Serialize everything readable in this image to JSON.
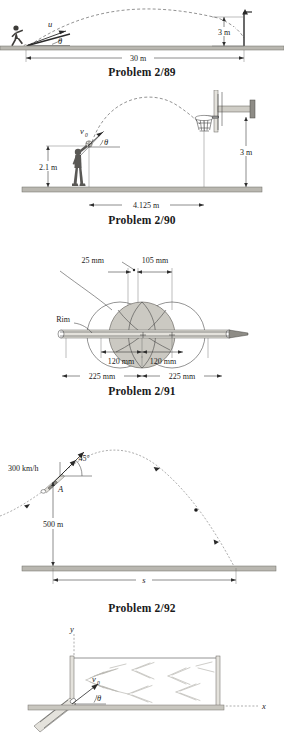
{
  "page": {
    "width": 284,
    "height": 737,
    "background": "#ffffff",
    "ink": "#1b1b1b",
    "ground_color": "#b9b7b0"
  },
  "figures": [
    {
      "id": "problem-2-89",
      "caption": "Problem 2/89",
      "subject": "soccer kick over crossbar",
      "labels": {
        "velocity": "u",
        "angle": "θ",
        "height": "3 m",
        "range": "30 m"
      }
    },
    {
      "id": "problem-2-90",
      "caption": "Problem 2/90",
      "subject": "basketball free throw shot",
      "labels": {
        "velocity": "v",
        "velocity_sub": "0",
        "angle": "θ",
        "release_height": "2.1 m",
        "rim_height": "3 m",
        "horizontal_distance": "4.125 m"
      }
    },
    {
      "id": "problem-2-91",
      "caption": "Problem 2/91",
      "subject": "basketball passing through rim clearances",
      "labels": {
        "rim": "Rim",
        "clearance_left": "25 mm",
        "clearance_right": "105 mm",
        "half_ball_left": "120 mm",
        "half_ball_right": "120 mm",
        "half_rim_left": "225 mm",
        "half_rim_right": "225 mm"
      }
    },
    {
      "id": "problem-2-92",
      "caption": "Problem 2/92",
      "subject": "aircraft projectile launched at altitude",
      "labels": {
        "speed": "300 km/h",
        "angle": "45°",
        "point": "A",
        "altitude": "500 m",
        "range": "s"
      }
    },
    {
      "id": "problem-2-93",
      "caption": "",
      "subject": "water jet from nozzle into tank",
      "labels": {
        "axis_y": "y",
        "axis_x": "x",
        "velocity": "v",
        "velocity_sub": "0",
        "angle": "θ"
      }
    }
  ]
}
